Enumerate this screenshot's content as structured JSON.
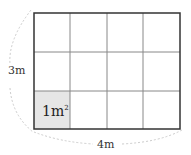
{
  "diagram": {
    "type": "area-grid",
    "rows": 3,
    "cols": 4,
    "shaded_cell": {
      "row": 3,
      "col": 1,
      "fill": "#e6e6e6"
    },
    "unit_label": {
      "base": "1m",
      "sup": "2"
    },
    "height_label": "3m",
    "width_label": "4m",
    "colors": {
      "outer_border": "#333333",
      "inner_lines": "#888888",
      "arc": "#cccccc"
    }
  }
}
